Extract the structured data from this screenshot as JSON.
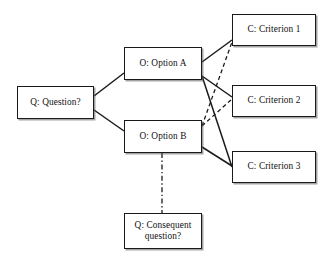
{
  "diagram": {
    "ink_color": "#1a1a1a",
    "background_color": "#ffffff",
    "nodes": [
      {
        "id": "question",
        "label": "Q:  Question?",
        "prefix": "Q",
        "kind": "question"
      },
      {
        "id": "option_a",
        "label": "O:  Option A",
        "prefix": "O",
        "kind": "option"
      },
      {
        "id": "option_b",
        "label": "O:  Option B",
        "prefix": "O",
        "kind": "option"
      },
      {
        "id": "criterion_1",
        "label": "C:  Criterion 1",
        "prefix": "C",
        "kind": "criterion"
      },
      {
        "id": "criterion_2",
        "label": "C:  Criterion 2",
        "prefix": "C",
        "kind": "criterion"
      },
      {
        "id": "criterion_3",
        "label": "C:  Criterion 3",
        "prefix": "C",
        "kind": "criterion"
      },
      {
        "id": "consequent",
        "label": "Q:  Consequent\nquestion?",
        "prefix": "Q",
        "kind": "question"
      }
    ],
    "edges": [
      {
        "id": "e1",
        "from": "question",
        "to": "option_a",
        "style": "solid",
        "x1": 94,
        "y1": 96,
        "x2": 124,
        "y2": 73
      },
      {
        "id": "e2",
        "from": "question",
        "to": "option_b",
        "style": "solid",
        "x1": 94,
        "y1": 110,
        "x2": 124,
        "y2": 131
      },
      {
        "id": "e3",
        "from": "option_a",
        "to": "criterion_1",
        "style": "solid",
        "x1": 202,
        "y1": 62,
        "x2": 232,
        "y2": 40
      },
      {
        "id": "e4",
        "from": "option_a",
        "to": "criterion_2",
        "style": "solid",
        "x1": 202,
        "y1": 76,
        "x2": 232,
        "y2": 97
      },
      {
        "id": "e5",
        "from": "option_a",
        "to": "criterion_3",
        "style": "solid",
        "x1": 202,
        "y1": 76,
        "x2": 232,
        "y2": 167
      },
      {
        "id": "e6",
        "from": "option_b",
        "to": "criterion_1",
        "style": "dashed",
        "x1": 202,
        "y1": 126,
        "x2": 232,
        "y2": 42
      },
      {
        "id": "e7",
        "from": "option_b",
        "to": "criterion_2",
        "style": "dashed",
        "x1": 202,
        "y1": 126,
        "x2": 232,
        "y2": 99
      },
      {
        "id": "e8",
        "from": "option_b",
        "to": "criterion_3",
        "style": "solid",
        "x1": 202,
        "y1": 147,
        "x2": 232,
        "y2": 166
      },
      {
        "id": "e9",
        "from": "option_b",
        "to": "consequent",
        "style": "dash-dot",
        "x1": 162,
        "y1": 153,
        "x2": 162,
        "y2": 213
      }
    ]
  }
}
